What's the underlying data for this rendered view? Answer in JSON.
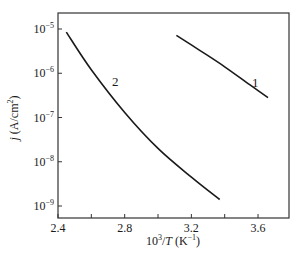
{
  "chart_data": {
    "type": "line",
    "title": "",
    "xlabel": "10^3/T (K^-1)",
    "ylabel": "j (A/cm^2)",
    "xlim": [
      2.4,
      3.79
    ],
    "ylim": [
      1e-09,
      1e-05
    ],
    "yscale": "log",
    "grid": false,
    "legend": "inline labels",
    "x_ticks": [
      2.4,
      2.6,
      2.8,
      3.0,
      3.2,
      3.4,
      3.6
    ],
    "x_tick_labels": [
      "2.4",
      "",
      "2.8",
      "",
      "3.2",
      "",
      "3.6"
    ],
    "y_ticks": [
      1e-09,
      1e-08,
      1e-07,
      1e-06,
      1e-05
    ],
    "y_tick_labels": [
      {
        "base": "10",
        "exp": "−9"
      },
      {
        "base": "10",
        "exp": "−8"
      },
      {
        "base": "10",
        "exp": "−7"
      },
      {
        "base": "10",
        "exp": "−6"
      },
      {
        "base": "10",
        "exp": "−5"
      }
    ],
    "series": [
      {
        "name": "1",
        "x": [
          3.11,
          3.25,
          3.4,
          3.55,
          3.66
        ],
        "values": [
          7.2e-06,
          3.3e-06,
          1.4e-06,
          5.5e-07,
          2.8e-07
        ]
      },
      {
        "name": "2",
        "x": [
          2.45,
          2.6,
          2.8,
          3.0,
          3.2,
          3.37
        ],
        "values": [
          8.5e-06,
          1.2e-06,
          1.3e-07,
          2e-08,
          4.5e-09,
          1.4e-09
        ]
      }
    ]
  },
  "axis": {
    "xlabel_base": "10",
    "xlabel_exp": "3",
    "xlabel_mid": "/",
    "xlabel_var": "T",
    "xlabel_unit_open": " (K",
    "xlabel_unit_exp": "−1",
    "xlabel_unit_close": ")",
    "ylabel_var": "j",
    "ylabel_unit_open": " (A/cm",
    "ylabel_unit_exp": "2",
    "ylabel_unit_close": ")"
  },
  "labels": {
    "curve1": "1",
    "curve2": "2"
  },
  "colors": {
    "line": "#1a1a1a",
    "frame": "#333333",
    "background": "#ffffff"
  }
}
